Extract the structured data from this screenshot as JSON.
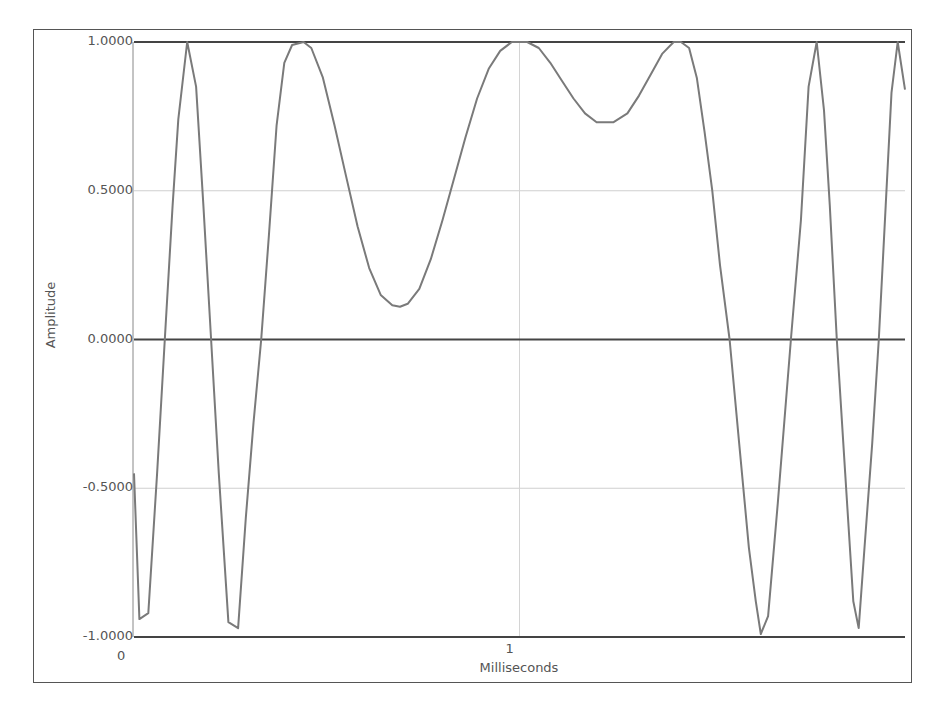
{
  "chart_data": {
    "type": "line",
    "title": "",
    "xlabel": "Milliseconds",
    "ylabel": "Amplitude",
    "xlim": [
      0,
      2
    ],
    "ylim": [
      -1,
      1
    ],
    "x_ticks": [
      {
        "value": 0,
        "label": "0"
      },
      {
        "value": 1,
        "label": "1"
      }
    ],
    "y_ticks": [
      {
        "value": 1.0,
        "label": "1.0000"
      },
      {
        "value": 0.5,
        "label": "0.5000"
      },
      {
        "value": 0.0,
        "label": "0.0000"
      },
      {
        "value": -0.5,
        "label": "-0.5000"
      },
      {
        "value": -1.0,
        "label": "-1.0000"
      }
    ],
    "grid": true,
    "legend": null,
    "series": [
      {
        "name": "signal",
        "color": "#7a7a7a",
        "x": [
          0.0,
          0.014,
          0.037,
          0.06,
          0.08,
          0.1,
          0.115,
          0.138,
          0.161,
          0.18,
          0.2,
          0.22,
          0.245,
          0.27,
          0.29,
          0.31,
          0.33,
          0.35,
          0.37,
          0.39,
          0.41,
          0.44,
          0.46,
          0.49,
          0.52,
          0.55,
          0.58,
          0.61,
          0.64,
          0.67,
          0.69,
          0.71,
          0.74,
          0.77,
          0.8,
          0.83,
          0.86,
          0.89,
          0.92,
          0.95,
          0.98,
          1.0,
          1.02,
          1.05,
          1.08,
          1.11,
          1.14,
          1.17,
          1.2,
          1.243,
          1.28,
          1.31,
          1.34,
          1.37,
          1.4,
          1.419,
          1.44,
          1.46,
          1.48,
          1.5,
          1.52,
          1.545,
          1.57,
          1.595,
          1.613,
          1.626,
          1.645,
          1.67,
          1.704,
          1.73,
          1.75,
          1.771,
          1.79,
          1.805,
          1.823,
          1.845,
          1.866,
          1.88,
          1.895,
          1.915,
          1.932,
          1.95,
          1.965,
          1.981,
          2.0
        ],
        "y": [
          -0.45,
          -0.94,
          -0.92,
          -0.45,
          0.0,
          0.45,
          0.74,
          1.0,
          0.85,
          0.45,
          0.0,
          -0.45,
          -0.95,
          -0.97,
          -0.6,
          -0.28,
          0.0,
          0.35,
          0.72,
          0.93,
          0.99,
          1.0,
          0.98,
          0.88,
          0.72,
          0.55,
          0.38,
          0.24,
          0.15,
          0.115,
          0.11,
          0.12,
          0.17,
          0.27,
          0.4,
          0.54,
          0.68,
          0.81,
          0.91,
          0.97,
          1.0,
          1.0,
          1.0,
          0.98,
          0.93,
          0.87,
          0.81,
          0.76,
          0.73,
          0.73,
          0.76,
          0.82,
          0.89,
          0.96,
          1.0,
          1.0,
          0.98,
          0.88,
          0.7,
          0.5,
          0.25,
          0.0,
          -0.35,
          -0.7,
          -0.88,
          -0.99,
          -0.93,
          -0.55,
          0.0,
          0.4,
          0.85,
          1.0,
          0.77,
          0.45,
          0.0,
          -0.45,
          -0.88,
          -0.97,
          -0.7,
          -0.35,
          0.0,
          0.45,
          0.83,
          1.0,
          0.84
        ]
      }
    ]
  }
}
